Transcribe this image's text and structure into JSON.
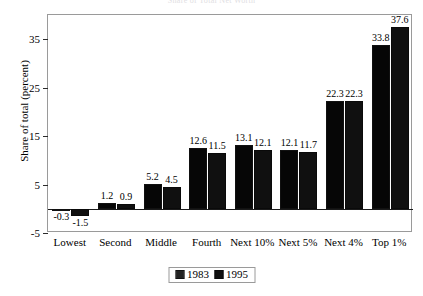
{
  "title_clipped": "Share of Total Net Worth",
  "chart_data": {
    "type": "bar",
    "title": "",
    "xlabel": "",
    "ylabel": "Share of total (percent)",
    "categories": [
      "Lowest",
      "Second",
      "Middle",
      "Fourth",
      "Next 10%",
      "Next 5%",
      "Next 4%",
      "Top 1%"
    ],
    "series": [
      {
        "name": "1983",
        "values": [
          -0.3,
          1.2,
          5.2,
          12.6,
          13.1,
          12.1,
          22.3,
          33.8
        ]
      },
      {
        "name": "1995",
        "values": [
          -1.5,
          0.9,
          4.5,
          11.5,
          12.1,
          11.7,
          22.3,
          37.6
        ]
      }
    ],
    "value_labels": {
      "1983": [
        "-0.3",
        "1.2",
        "5.2",
        "12.6",
        "13.1",
        "12.1",
        "22.3",
        "33.8"
      ],
      "1995": [
        "-1.5",
        "0.9",
        "4.5",
        "11.5",
        "12.1",
        "11.7",
        "22.3",
        "37.6"
      ]
    },
    "ylim": [
      -5,
      40
    ],
    "yticks": [
      -5,
      5,
      15,
      25,
      35
    ],
    "ytick_labels": [
      "-5",
      "5",
      "15",
      "25",
      "35"
    ],
    "grid": false,
    "legend_position": "bottom-center",
    "legend_entries": [
      "1983",
      "1995"
    ],
    "colors": {
      "series_1983": "#7d7d7d",
      "series_1995": "#101010",
      "frame": "#9a9a9a",
      "axis": "#1a1a1a"
    }
  }
}
